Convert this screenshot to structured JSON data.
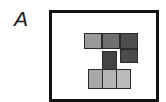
{
  "panel": {
    "label": "A"
  },
  "blocks": [
    {
      "id": "top-left",
      "x": 84,
      "y": 33,
      "w": 18,
      "h": 16,
      "color": "#9a9a9a"
    },
    {
      "id": "top-middle",
      "x": 102,
      "y": 33,
      "w": 18,
      "h": 16,
      "color": "#707070"
    },
    {
      "id": "top-right",
      "x": 120,
      "y": 33,
      "w": 18,
      "h": 16,
      "color": "#4e4e4e"
    },
    {
      "id": "right-lower",
      "x": 120,
      "y": 49,
      "w": 18,
      "h": 14,
      "color": "#4a4a4a"
    },
    {
      "id": "middle-stem",
      "x": 102,
      "y": 51,
      "w": 15,
      "h": 19,
      "color": "#444444"
    },
    {
      "id": "bottom-left",
      "x": 88,
      "y": 69,
      "w": 15,
      "h": 20,
      "color": "#a8a8a8"
    },
    {
      "id": "bottom-middle",
      "x": 102,
      "y": 69,
      "w": 15,
      "h": 20,
      "color": "#b4b4b4"
    },
    {
      "id": "bottom-right",
      "x": 116,
      "y": 69,
      "w": 15,
      "h": 20,
      "color": "#bcbcbc"
    }
  ]
}
